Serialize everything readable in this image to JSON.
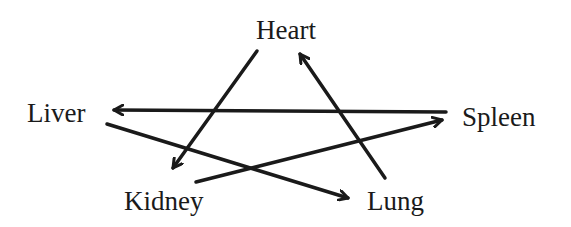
{
  "diagram": {
    "type": "directed-graph",
    "colors": {
      "stroke": "#1a1a1a",
      "text": "#1a1a1a",
      "background": "#ffffff"
    },
    "nodes": {
      "heart": {
        "label": "Heart"
      },
      "liver": {
        "label": "Liver"
      },
      "spleen": {
        "label": "Spleen"
      },
      "kidney": {
        "label": "Kidney"
      },
      "lung": {
        "label": "Lung"
      }
    },
    "edges": [
      {
        "from": "Heart",
        "to": "Kidney"
      },
      {
        "from": "Lung",
        "to": "Heart"
      },
      {
        "from": "Spleen",
        "to": "Liver"
      },
      {
        "from": "Liver",
        "to": "Lung"
      },
      {
        "from": "Kidney",
        "to": "Spleen"
      }
    ]
  }
}
